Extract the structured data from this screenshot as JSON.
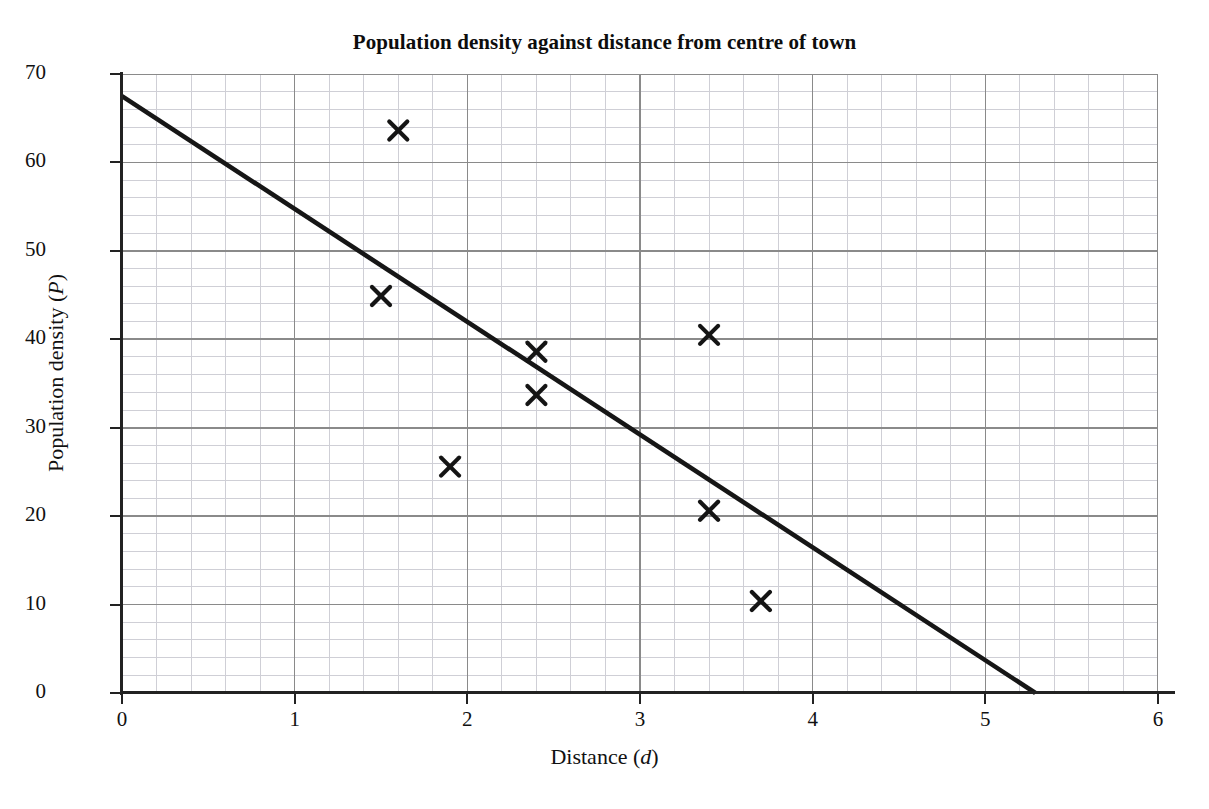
{
  "chart_data": {
    "type": "scatter",
    "title": "Population density against distance from centre of town",
    "xlabel": "Distance (d)",
    "xlabel_text": "Distance (",
    "xlabel_var": "d",
    "xlabel_tail": ")",
    "ylabel": "Population density (P)",
    "ylabel_text": "Population density (",
    "ylabel_var": "P",
    "ylabel_tail": ")",
    "xlim": [
      0,
      6
    ],
    "ylim": [
      0,
      70
    ],
    "x_ticks": [
      0,
      1,
      2,
      3,
      4,
      5,
      6
    ],
    "x_tick_labels": [
      "0",
      "1",
      "2",
      "3",
      "4",
      "5",
      "6"
    ],
    "y_ticks": [
      0,
      10,
      20,
      30,
      40,
      50,
      60,
      70
    ],
    "y_tick_labels": [
      "0",
      "10",
      "20",
      "30",
      "40",
      "50",
      "60",
      "70"
    ],
    "grid": true,
    "grid_major_x_step": 1,
    "grid_major_y_step": 10,
    "grid_minor_x_step": 0.2,
    "grid_minor_y_step": 2,
    "grid_major_color": "#8a8a8a",
    "grid_minor_color": "#cfcfd6",
    "legend": "none",
    "marker": "x",
    "marker_color": "#141414",
    "points": [
      {
        "x": 1.5,
        "y": 44.9
      },
      {
        "x": 1.6,
        "y": 63.6
      },
      {
        "x": 1.9,
        "y": 25.6
      },
      {
        "x": 2.4,
        "y": 38.6
      },
      {
        "x": 2.4,
        "y": 33.7
      },
      {
        "x": 3.4,
        "y": 40.5
      },
      {
        "x": 3.4,
        "y": 20.6
      },
      {
        "x": 3.7,
        "y": 10.4
      }
    ],
    "series": [
      {
        "name": "line of best fit",
        "type": "line",
        "color": "#161616",
        "x": [
          0,
          5.29
        ],
        "y": [
          67.5,
          0
        ]
      }
    ]
  }
}
